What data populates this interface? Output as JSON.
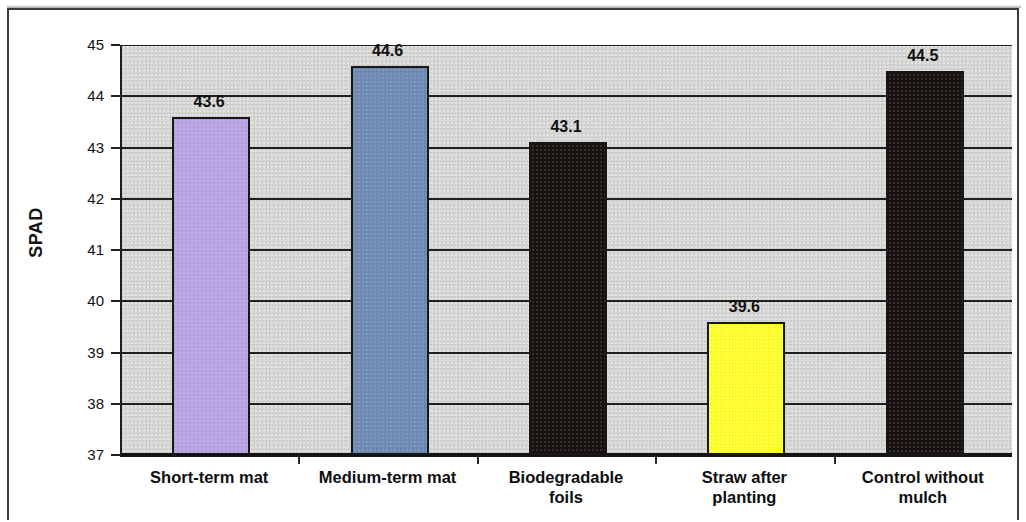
{
  "chart_data": {
    "type": "bar",
    "title": "",
    "xlabel": "",
    "ylabel": "SPAD",
    "ylim": [
      37,
      45
    ],
    "grid": true,
    "legend": "none",
    "ytick_labels": [
      "45",
      "44",
      "43",
      "42",
      "41",
      "40",
      "39",
      "38",
      "37"
    ],
    "ytick_values": [
      45,
      44,
      43,
      42,
      41,
      40,
      39,
      38,
      37
    ],
    "categories": [
      "Short-term mat",
      "Medium-term mat",
      "Biodegradable\nfoils",
      "Straw after\nplanting",
      "Control without\nmulch"
    ],
    "values": [
      43.6,
      44.6,
      43.1,
      39.6,
      44.5
    ],
    "value_labels": [
      "43.6",
      "44.6",
      "43.1",
      "39.6",
      "44.5"
    ],
    "bar_colors": [
      "#b7a3e2",
      "#6e8ab4",
      "#17120f",
      "#ffff2e",
      "#17120f"
    ],
    "bar_edge_color": "#17171a",
    "plot_background": "#d4d4d2",
    "page_background": "#ffffff"
  }
}
